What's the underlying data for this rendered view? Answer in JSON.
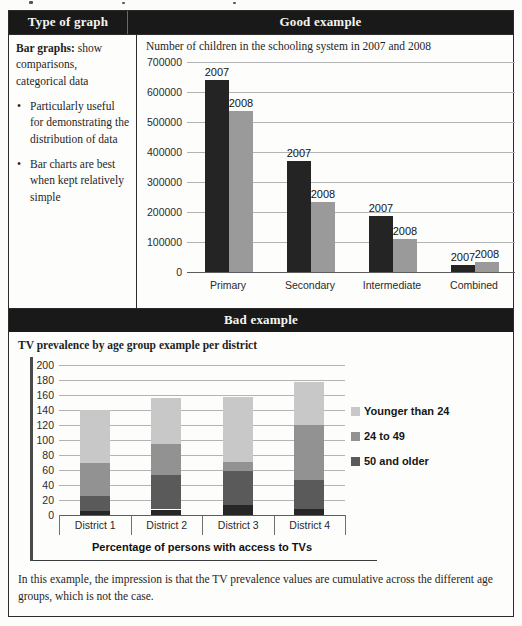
{
  "header": {
    "left": "Type of graph",
    "right": "Good example",
    "bad": "Bad example"
  },
  "left_column": {
    "lead_bold": "Bar graphs:",
    "lead_rest": "show comparisons, categorical data",
    "bullet_glyph": "•",
    "bullets": [
      "Particularly useful for demonstrating the distribution of data",
      "Bar charts are best when kept relatively simple"
    ]
  },
  "good": {
    "title": "Number of children in the schooling system in 2007 and 2008"
  },
  "bad": {
    "title": "TV prevalence by age group example per district",
    "xlabel": "Percentage of persons with access to TVs"
  },
  "caption": "In this example, the impression is that the TV prevalence values are cumulative across the different age groups, which is not the case.",
  "colors": {
    "header_bg": "#191919",
    "header_text": "#f5f5f0",
    "series_2007": "#242424",
    "series_2008": "#9a9a9a",
    "stack_younger": "#c8c8c8",
    "stack_mid": "#929292",
    "stack_older": "#5a5a5a",
    "stack_base": "#262626",
    "gridline": "#b4b4b4"
  },
  "chart_data": [
    {
      "type": "bar",
      "title": "Number of children in the schooling system in 2007 and 2008",
      "categories": [
        "Primary",
        "Secondary",
        "Intermediate",
        "Combined"
      ],
      "series": [
        {
          "name": "2007",
          "color": "#242424",
          "values": [
            640000,
            370000,
            188000,
            22000
          ]
        },
        {
          "name": "2008",
          "color": "#9a9a9a",
          "values": [
            535000,
            232000,
            110000,
            35000
          ]
        }
      ],
      "ylim": [
        0,
        700000
      ],
      "ytick_step": 100000,
      "grid": true,
      "bar_labels": "series name printed above each bar",
      "legend_position": "none"
    },
    {
      "type": "stacked-bar",
      "title": "TV prevalence by age group example per district",
      "categories": [
        "District 1",
        "District 2",
        "District 3",
        "District 4"
      ],
      "series": [
        {
          "name": "50 and older",
          "color": "#5a5a5a",
          "values": [
            20,
            47,
            45,
            38
          ]
        },
        {
          "name": "24 to 49",
          "color": "#929292",
          "values": [
            45,
            41,
            12,
            73
          ]
        },
        {
          "name": "Younger than 24",
          "color": "#c8c8c8",
          "values": [
            70,
            61,
            87,
            57
          ]
        }
      ],
      "unlabeled_dark_base_segment": {
        "color": "#262626",
        "values": [
          5,
          7,
          13,
          9
        ]
      },
      "stack_totals": [
        140,
        156,
        157,
        177
      ],
      "ylim": [
        0,
        200
      ],
      "ytick_step": 20,
      "grid": true,
      "xlabel": "Percentage of persons with access to TVs",
      "legend_order_top_to_bottom": [
        "Younger than 24",
        "24 to 49",
        "50 and older"
      ],
      "legend_position": "right"
    }
  ]
}
